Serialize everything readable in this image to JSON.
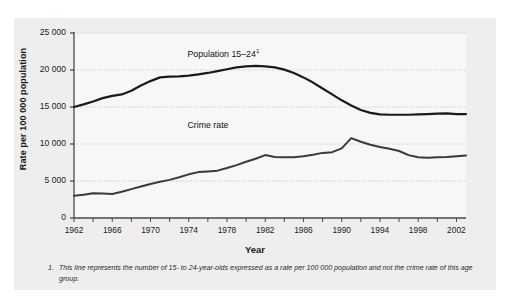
{
  "chart_data": {
    "type": "line",
    "title": "",
    "xlabel": "Year",
    "ylabel": "Rate per 100 000 population",
    "xlim": [
      1962,
      2003
    ],
    "ylim": [
      0,
      25000
    ],
    "grid": true,
    "legend_position": "inline-annotation",
    "ytick_labels": [
      "25 000",
      "20 000",
      "15 000",
      "10 000",
      "5 000",
      "0"
    ],
    "ytick_values": [
      25000,
      20000,
      15000,
      10000,
      5000,
      0
    ],
    "xtick_labels": [
      "1962",
      "1966",
      "1970",
      "1974",
      "1978",
      "1982",
      "1986",
      "1990",
      "1994",
      "1998",
      "2002"
    ],
    "xtick_values": [
      1962,
      1966,
      1970,
      1974,
      1978,
      1982,
      1986,
      1990,
      1994,
      1998,
      2002
    ],
    "minor_tick_interval": 2,
    "x": [
      1962,
      1963,
      1964,
      1965,
      1966,
      1967,
      1968,
      1969,
      1970,
      1971,
      1972,
      1973,
      1974,
      1975,
      1976,
      1977,
      1978,
      1979,
      1980,
      1981,
      1982,
      1983,
      1984,
      1985,
      1986,
      1987,
      1988,
      1989,
      1990,
      1991,
      1992,
      1993,
      1994,
      1995,
      1996,
      1997,
      1998,
      1999,
      2000,
      2001,
      2002,
      2003
    ],
    "series": [
      {
        "name": "Population 15–24",
        "label_text": "Population 15–24",
        "label_superscript": "1",
        "color": "#1a1a1a",
        "linewidth": 2.2,
        "values": [
          15000,
          15350,
          15750,
          16200,
          16500,
          16700,
          17200,
          17900,
          18500,
          19000,
          19100,
          19150,
          19250,
          19400,
          19600,
          19850,
          20100,
          20350,
          20500,
          20550,
          20500,
          20350,
          20050,
          19600,
          19000,
          18300,
          17500,
          16700,
          15900,
          15200,
          14600,
          14200,
          14000,
          13950,
          13950,
          13950,
          14000,
          14050,
          14100,
          14150,
          14050,
          14050
        ]
      },
      {
        "name": "Crime rate",
        "label_text": "Crime rate",
        "label_superscript": "",
        "color": "#3a3a3a",
        "linewidth": 2.0,
        "values": [
          3000,
          3150,
          3350,
          3300,
          3250,
          3550,
          3900,
          4250,
          4600,
          4900,
          5150,
          5500,
          5900,
          6200,
          6300,
          6400,
          6750,
          7150,
          7600,
          8000,
          8500,
          8250,
          8200,
          8200,
          8350,
          8550,
          8800,
          8900,
          9400,
          10800,
          10300,
          9900,
          9600,
          9350,
          9050,
          8500,
          8200,
          8150,
          8200,
          8250,
          8350,
          8450
        ]
      }
    ],
    "annotations": [
      {
        "text": "Population 15–24",
        "superscript": "1",
        "x": 1977,
        "y": 22200
      },
      {
        "text": "Crime rate",
        "superscript": "",
        "x": 1977,
        "y": 12500
      }
    ]
  },
  "footnote": {
    "number": "1.",
    "text": "This line represents the number of 15- to 24-year-olds expressed as a rate per 100 000 population and not the crime rate of this age group."
  },
  "colors": {
    "panel_background": "#eeeeee",
    "plot_background": "#f7f7f7",
    "axis": "#4a4a4a",
    "gridline": "#b8b8b8",
    "text": "#1a1a1a"
  }
}
